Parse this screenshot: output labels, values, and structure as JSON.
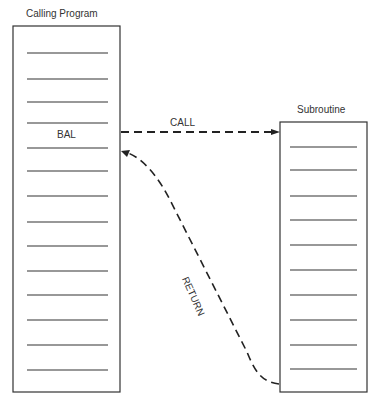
{
  "caller": {
    "title": "Calling Program",
    "instruction": "BAL",
    "line_count": 14
  },
  "subroutine": {
    "title": "Subroutine",
    "line_count": 10
  },
  "arrows": {
    "call_label": "CALL",
    "return_label": "RETURN"
  }
}
